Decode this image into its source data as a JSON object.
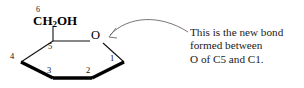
{
  "figure": {
    "kind": "haworth-projection-pyranose-ring",
    "background_color": "#ffffff",
    "line_color": "#000000",
    "bold_bond_color": "#000000",
    "arrow_color": "#555555"
  },
  "structure": {
    "ring_oxygen_label": "O",
    "substituent": {
      "formula_prefix": "CH",
      "formula_subscript": "2",
      "formula_suffix": "OH",
      "carbon_number": "6"
    },
    "carbon_numbers": {
      "c1": "1",
      "c2": "2",
      "c3": "3",
      "c4": "4",
      "c5": "5",
      "c6": "6"
    }
  },
  "annotation": {
    "line1": "This is the new bond",
    "line2": "formed between",
    "line3": "O of C5 and C1."
  }
}
